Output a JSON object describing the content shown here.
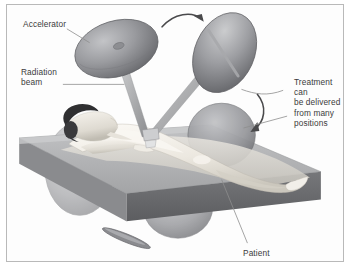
{
  "figure": {
    "style": "grayscale medical illustration",
    "border_color": "#b9b9b9",
    "background_color": "#fdfdfd"
  },
  "labels": {
    "accelerator": "Accelerator",
    "radiation_beam": "Radiation\nbeam",
    "treatment": "Treatment can\nbe delivered\nfrom many\npositions",
    "patient": "Patient"
  },
  "palette": {
    "text": "#3b3b3b",
    "leader_line": "#8d8d8d",
    "gantry_head_dark": "#6f7073",
    "gantry_head_light": "#b9babd",
    "gantry_arm": "#a9aaac",
    "table_top": "#b2b3b5",
    "table_edge": "#6a6b6e",
    "table_side": "#8e8f92",
    "skin_light": "#f2efe9",
    "skin_shadow": "#cfcbc2",
    "hair": "#2f2f31",
    "ghost_head": "#9a9b9e",
    "arrow": "#4a4a4c"
  },
  "elements": {
    "accelerator_heads": [
      {
        "name": "gantry-head-left",
        "state": "upper-left position"
      },
      {
        "name": "gantry-head-right",
        "state": "upper-right position"
      },
      {
        "name": "gantry-head-ghost-left",
        "state": "translucent side position"
      },
      {
        "name": "gantry-head-ghost-right",
        "state": "translucent far-side position"
      },
      {
        "name": "gantry-head-ghost-below",
        "state": "translucent beneath table"
      },
      {
        "name": "gantry-head-edge-on",
        "state": "edge-on view below table"
      }
    ],
    "arrows": [
      {
        "name": "rotation-arrow-top",
        "direction": "left-to-right arc"
      },
      {
        "name": "rotation-arrow-right",
        "direction": "downward arc"
      }
    ],
    "beams": [
      {
        "name": "beam-arm-left"
      },
      {
        "name": "beam-arm-right"
      }
    ],
    "patient": {
      "name": "patient-body",
      "position": "supine on treatment couch"
    },
    "couch": {
      "name": "treatment-couch"
    }
  }
}
